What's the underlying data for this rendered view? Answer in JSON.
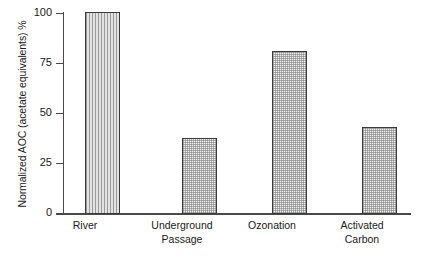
{
  "chart_data": {
    "type": "bar",
    "title": "",
    "xlabel": "",
    "ylabel": "Normalized AOC (acetate equivalents) %",
    "ylim": [
      0,
      100
    ],
    "yticks": [
      0,
      25,
      50,
      75,
      100
    ],
    "ytick_labels": [
      "0",
      "25",
      "50",
      "75",
      "100"
    ],
    "grid": false,
    "legend": null,
    "categories": [
      "River",
      "Underground Passage",
      "Ozonation",
      "Activated Carbon"
    ],
    "category_lines": [
      [
        "River"
      ],
      [
        "Underground",
        "Passage"
      ],
      [
        "Ozonation"
      ],
      [
        "Activated",
        "Carbon"
      ]
    ],
    "values": [
      100.5,
      37.5,
      81,
      43
    ],
    "bar_fills": [
      "vertical-lines",
      "stipple-dots",
      "stipple-dots",
      "stipple-dots"
    ],
    "colors": {
      "axis": "#4a4a4a",
      "bar_edge": "#3a3a3a",
      "bar_fill_lines": "#d2d2d2",
      "bar_fill_dots": "#f0f0f0",
      "text": "#1a1a1a",
      "background": "#ffffff"
    }
  }
}
